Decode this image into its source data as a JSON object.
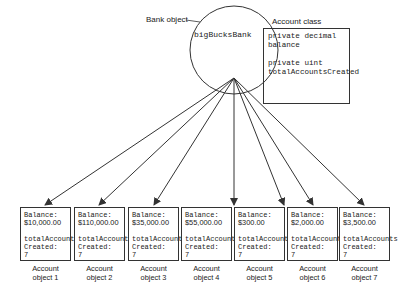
{
  "bank": {
    "label": "Bank object",
    "instance_name": "bigBucksBank"
  },
  "account_class": {
    "label": "Account class",
    "field1_line1": "private decimal",
    "field1_line2": "balance",
    "field2_line1": "private uint",
    "field2_line2": "totalAccountsCreated"
  },
  "accounts": [
    {
      "balance_label": "Balance:",
      "balance": "$10,000.00",
      "total_label_1": "totalAccounts",
      "total_label_2": "Created:",
      "total": "7",
      "caption_1": "Account",
      "caption_2": "object 1"
    },
    {
      "balance_label": "Balance:",
      "balance": "$110,000.00",
      "total_label_1": "totalAccounts",
      "total_label_2": "Created:",
      "total": "7",
      "caption_1": "Account",
      "caption_2": "object 2"
    },
    {
      "balance_label": "Balance:",
      "balance": "$35,000.00",
      "total_label_1": "totalAccounts",
      "total_label_2": "Created:",
      "total": "7",
      "caption_1": "Account",
      "caption_2": "object 3"
    },
    {
      "balance_label": "Balance:",
      "balance": "$55,000.00",
      "total_label_1": "totalAccounts",
      "total_label_2": "Created:",
      "total": "7",
      "caption_1": "Account",
      "caption_2": "object 4"
    },
    {
      "balance_label": "Balance:",
      "balance": "$300.00",
      "total_label_1": "totalAccounts",
      "total_label_2": "Created:",
      "total": "7",
      "caption_1": "Account",
      "caption_2": "object 5"
    },
    {
      "balance_label": "Balance:",
      "balance": "$2,000.00",
      "total_label_1": "totalAccounts",
      "total_label_2": "Created:",
      "total": "7",
      "caption_1": "Account",
      "caption_2": "object 6"
    },
    {
      "balance_label": "Balance:",
      "balance": "$3,500.00",
      "total_label_1": "totalAccounts",
      "total_label_2": "Created:",
      "total": "7",
      "caption_1": "Account",
      "caption_2": "object 7"
    }
  ],
  "colors": {
    "stroke": "#333333",
    "text": "#222222",
    "background": "#ffffff"
  }
}
